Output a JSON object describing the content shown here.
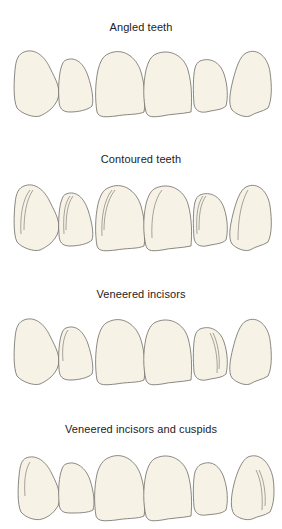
{
  "figure": {
    "panels": [
      {
        "id": "angled",
        "caption": "Angled teeth",
        "colors": {
          "tooth_fill": "#f6f3e6",
          "outline": "#6e6a66"
        }
      },
      {
        "id": "contoured",
        "caption": "Contoured teeth"
      },
      {
        "id": "veneered-incisors",
        "caption": "Veneered incisors"
      },
      {
        "id": "veneered-incisors-cuspids",
        "caption": "Veneered incisors and cuspids"
      }
    ]
  }
}
